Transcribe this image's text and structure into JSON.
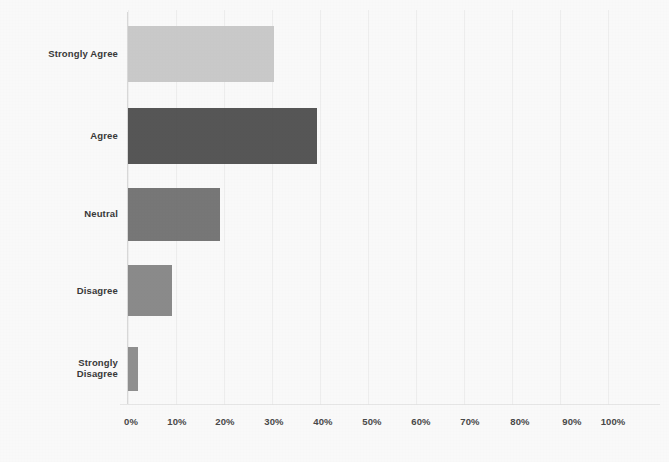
{
  "chart_data": {
    "type": "bar",
    "orientation": "horizontal",
    "title": "",
    "subtitle": "",
    "xlabel": "",
    "ylabel": "",
    "categories": [
      "Strongly Agree",
      "Agree",
      "Neutral",
      "Disagree",
      "Strongly Disagree"
    ],
    "values": [
      30,
      39,
      19,
      9,
      2
    ],
    "value_unit": "%",
    "xlim": [
      0,
      100
    ],
    "xticks": [
      0,
      10,
      20,
      30,
      40,
      50,
      60,
      70,
      80,
      90,
      100
    ],
    "xtick_labels": [
      "0%",
      "10%",
      "20%",
      "30%",
      "40%",
      "50%",
      "60%",
      "70%",
      "80%",
      "90%",
      "100%"
    ],
    "grid": true,
    "legend": "none",
    "series": [
      {
        "name": "Response distribution",
        "values": [
          30,
          39,
          19,
          9,
          2
        ]
      }
    ],
    "bars": [
      {
        "label": "Strongly Agree",
        "label_lines": [
          "Strongly Agree"
        ],
        "value": 30,
        "color": "#c9c9c9"
      },
      {
        "label": "Agree",
        "label_lines": [
          "Agree"
        ],
        "value": 39,
        "color": "#4b4b4b"
      },
      {
        "label": "Neutral",
        "label_lines": [
          "Neutral"
        ],
        "value": 19,
        "color": "#6f6f6f"
      },
      {
        "label": "Disagree",
        "label_lines": [
          "Disagree"
        ],
        "value": 9,
        "color": "#848484"
      },
      {
        "label": "Strongly Disagree",
        "label_lines": [
          "Strongly",
          "Disagree"
        ],
        "value": 2,
        "color": "#8a8a8a"
      }
    ]
  },
  "colors": {
    "background": "#fdfdfd",
    "axis": "#dcdcdc",
    "gridline": "#f1f1f1",
    "tick_text": "#4a4a4a",
    "category_text": "#3a3a3a"
  }
}
